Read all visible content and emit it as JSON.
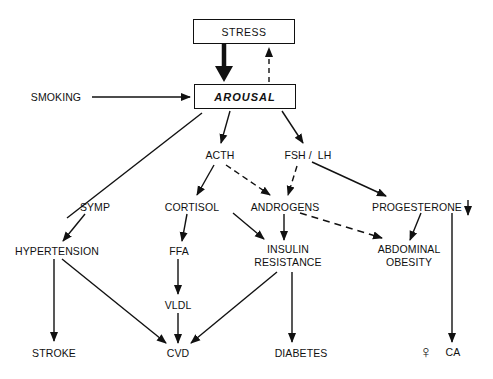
{
  "diagram": {
    "nodes": {
      "stress": "STRESS",
      "arousal": "AROUSAL",
      "smoking": "SMOKING",
      "acth": "ACTH",
      "fsh_lh": "FSH /  LH",
      "symp": "SYMP",
      "cortisol": "CORTISOL",
      "androgens": "ANDROGENS",
      "progesterone": "PROGESTERONE",
      "progesterone_marker": "↓",
      "hypertension": "HYPERTENSION",
      "ffa": "FFA",
      "insulin_resistance_line1": "INSULIN",
      "insulin_resistance_line2": "RESISTANCE",
      "abdominal_obesity_line1": "ABDOMINAL",
      "abdominal_obesity_line2": "OBESITY",
      "vldl": "VLDL",
      "stroke": "STROKE",
      "cvd": "CVD",
      "diabetes": "DIABETES",
      "female_symbol": "♀",
      "ca": "CA"
    },
    "edges": [
      {
        "from": "STRESS",
        "to": "AROUSAL",
        "style": "bold"
      },
      {
        "from": "AROUSAL",
        "to": "STRESS",
        "style": "dashed"
      },
      {
        "from": "SMOKING",
        "to": "AROUSAL",
        "style": "solid"
      },
      {
        "from": "AROUSAL",
        "to": "SYMP",
        "style": "solid"
      },
      {
        "from": "AROUSAL",
        "to": "ACTH",
        "style": "solid"
      },
      {
        "from": "AROUSAL",
        "to": "FSH / LH",
        "style": "solid"
      },
      {
        "from": "ACTH",
        "to": "CORTISOL",
        "style": "solid"
      },
      {
        "from": "ACTH",
        "to": "ANDROGENS",
        "style": "dashed"
      },
      {
        "from": "FSH / LH",
        "to": "ANDROGENS",
        "style": "dashed"
      },
      {
        "from": "FSH / LH",
        "to": "PROGESTERONE",
        "style": "solid"
      },
      {
        "from": "SYMP",
        "to": "HYPERTENSION",
        "style": "solid"
      },
      {
        "from": "CORTISOL",
        "to": "FFA",
        "style": "solid"
      },
      {
        "from": "CORTISOL",
        "to": "INSULIN RESISTANCE",
        "style": "solid"
      },
      {
        "from": "ANDROGENS",
        "to": "INSULIN RESISTANCE",
        "style": "solid"
      },
      {
        "from": "ANDROGENS",
        "to": "ABDOMINAL OBESITY",
        "style": "dashed"
      },
      {
        "from": "PROGESTERONE",
        "to": "ABDOMINAL OBESITY",
        "style": "solid"
      },
      {
        "from": "PROGESTERONE",
        "to": "♀ CA",
        "style": "solid"
      },
      {
        "from": "HYPERTENSION",
        "to": "STROKE",
        "style": "solid"
      },
      {
        "from": "HYPERTENSION",
        "to": "CVD",
        "style": "solid"
      },
      {
        "from": "FFA",
        "to": "VLDL",
        "style": "solid"
      },
      {
        "from": "VLDL",
        "to": "CVD",
        "style": "solid"
      },
      {
        "from": "INSULIN RESISTANCE",
        "to": "CVD",
        "style": "solid"
      },
      {
        "from": "INSULIN RESISTANCE",
        "to": "DIABETES",
        "style": "solid"
      }
    ],
    "colors": {
      "ink": "#111111",
      "background": "#ffffff"
    }
  }
}
